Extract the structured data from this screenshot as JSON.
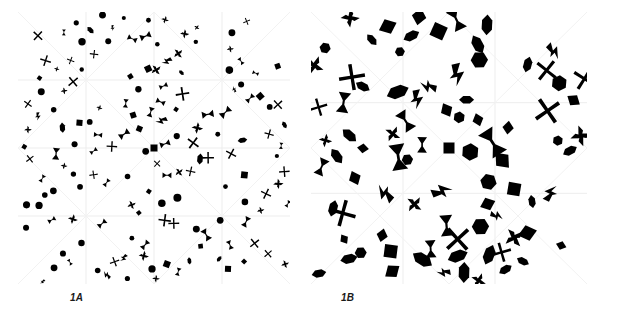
{
  "figure": {
    "background_color": "#ffffff",
    "ink_color": "#000000",
    "grid_color": "#ededed",
    "diagonal_color": "#f2f2f2"
  },
  "panels": [
    {
      "id": "1A",
      "caption": "1A",
      "description": "dense quasi-periodic tiling of small black glyphs",
      "grid_cells": 4,
      "cell_px": 68,
      "lattice_step": 17,
      "shape_scale": 0.62,
      "seed": 1371,
      "motifs": [
        "disc",
        "square",
        "bowtie",
        "pinwheel",
        "x-cross",
        "lozenge",
        "bolt"
      ],
      "motif_weights": [
        26,
        14,
        22,
        14,
        14,
        6,
        4
      ]
    },
    {
      "id": "1B",
      "caption": "1B",
      "description": "coarser quasi-periodic tiling of larger black glyphs",
      "grid_cells": 3,
      "cell_px": 92,
      "lattice_step": 23,
      "shape_scale": 1.0,
      "seed": 8842,
      "motifs": [
        "hexagon",
        "diamond",
        "lozenge",
        "bolt",
        "bowtie",
        "pinwheel",
        "x-cross",
        "square"
      ],
      "motif_weights": [
        16,
        16,
        16,
        14,
        16,
        10,
        8,
        4
      ]
    }
  ],
  "chart_data": {
    "type": "scatter",
    "title": "",
    "xlabel": "",
    "ylabel": "",
    "series": [
      {
        "name": "1A",
        "note": "16 x 16 lattice of glyphs, radially modulated density, centre square marker",
        "n_points": 256,
        "xlim": [
          0,
          272
        ],
        "ylim": [
          0,
          272
        ]
      },
      {
        "name": "1B",
        "note": "12 x 12 lattice of glyphs, radially modulated density, centre square marker",
        "n_points": 144,
        "xlim": [
          0,
          276
        ],
        "ylim": [
          0,
          272
        ]
      }
    ],
    "grid": true,
    "legend": "none"
  }
}
